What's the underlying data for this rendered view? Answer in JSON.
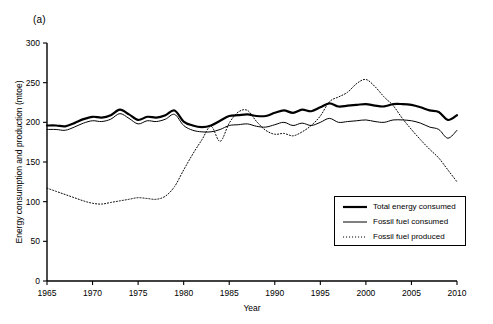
{
  "figure": {
    "panel_label": "(a)"
  },
  "chart_data": {
    "type": "line",
    "title": "",
    "xlabel": "Year",
    "ylabel": "Energy consumption and production (mtoe)",
    "xlim": [
      1965,
      2010
    ],
    "ylim": [
      0,
      300
    ],
    "xticks": [
      1965,
      1970,
      1975,
      1980,
      1985,
      1990,
      1995,
      2000,
      2005,
      2010
    ],
    "xticklabels": [
      "1965",
      "1970",
      "1975",
      "1980",
      "1985",
      "1990",
      "1995",
      "2000",
      "2005",
      "2010"
    ],
    "yticks": [
      0,
      50,
      100,
      150,
      200,
      250,
      300
    ],
    "yticklabels": [
      "0",
      "50",
      "100",
      "150",
      "200",
      "250",
      "300"
    ],
    "grid": false,
    "legend_position": "lower right",
    "x": [
      1965,
      1966,
      1967,
      1968,
      1969,
      1970,
      1971,
      1972,
      1973,
      1974,
      1975,
      1976,
      1977,
      1978,
      1979,
      1980,
      1981,
      1982,
      1983,
      1984,
      1985,
      1986,
      1987,
      1988,
      1989,
      1990,
      1991,
      1992,
      1993,
      1994,
      1995,
      1996,
      1997,
      1998,
      1999,
      2000,
      2001,
      2002,
      2003,
      2004,
      2005,
      2006,
      2007,
      2008,
      2009,
      2010
    ],
    "series": [
      {
        "name": "Total energy consumed",
        "style": "thick-solid",
        "color": "#000000",
        "values": [
          196,
          196,
          195,
          199,
          204,
          207,
          206,
          209,
          216,
          210,
          203,
          207,
          206,
          209,
          215,
          201,
          196,
          194,
          196,
          202,
          208,
          209,
          210,
          208,
          208,
          212,
          215,
          212,
          216,
          214,
          219,
          224,
          220,
          221,
          222,
          223,
          221,
          220,
          223,
          223,
          222,
          219,
          215,
          213,
          203,
          209
        ]
      },
      {
        "name": "Fossil fuel consumed",
        "style": "thin-solid",
        "color": "#000000",
        "values": [
          191,
          191,
          190,
          194,
          199,
          202,
          201,
          204,
          211,
          205,
          198,
          202,
          201,
          204,
          210,
          196,
          190,
          188,
          188,
          191,
          196,
          197,
          198,
          195,
          194,
          197,
          200,
          196,
          199,
          196,
          200,
          205,
          200,
          201,
          202,
          203,
          201,
          200,
          203,
          203,
          202,
          199,
          194,
          191,
          180,
          190
        ]
      },
      {
        "name": "Fossil fuel produced",
        "style": "dotted",
        "color": "#000000",
        "values": [
          117,
          113,
          109,
          105,
          101,
          98,
          97,
          99,
          101,
          103,
          105,
          104,
          103,
          107,
          119,
          140,
          160,
          178,
          195,
          176,
          199,
          213,
          215,
          201,
          190,
          185,
          186,
          183,
          188,
          196,
          208,
          226,
          232,
          238,
          249,
          254,
          245,
          232,
          221,
          205,
          191,
          178,
          166,
          155,
          140,
          125
        ]
      }
    ]
  },
  "legend": {
    "items": [
      {
        "label": "Total energy consumed",
        "key": "thick-solid-key"
      },
      {
        "label": "Fossil fuel consumed",
        "key": "thin-solid-key"
      },
      {
        "label": "Fossil fuel produced",
        "key": "dotted-key"
      }
    ]
  }
}
